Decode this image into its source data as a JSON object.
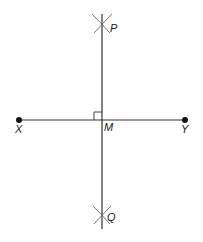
{
  "diagram": {
    "colors": {
      "line": "#333333",
      "arc": "#666666",
      "point": "#111111",
      "label": "#222222"
    },
    "points": {
      "X": {
        "label": "X"
      },
      "Y": {
        "label": "Y"
      },
      "M": {
        "label": "M"
      },
      "P": {
        "label": "P"
      },
      "Q": {
        "label": "Q"
      }
    },
    "segments": [
      {
        "from": "X",
        "to": "Y",
        "name": "segment-xy"
      },
      {
        "from": "P",
        "to": "Q",
        "name": "perpendicular-bisector-pq"
      }
    ],
    "annotations": {
      "right_angle_at": "M",
      "arc_intersections": [
        "P",
        "Q"
      ]
    }
  }
}
